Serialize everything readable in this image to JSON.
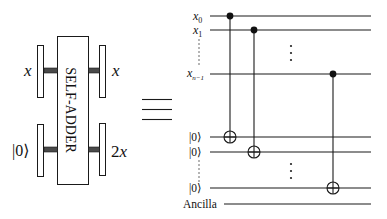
{
  "diagram": {
    "type": "quantum-circuit-equivalence",
    "colors": {
      "ink": "#1a1a1a",
      "connector": "#4a4a4a",
      "background": "#ffffff"
    },
    "block": {
      "label": "SELF-ADDER",
      "inputs": [
        {
          "label_var": "x",
          "label_text": "x"
        },
        {
          "label_text": "|0⟩"
        }
      ],
      "outputs": [
        {
          "label_var": "x",
          "label_text": "x"
        },
        {
          "label_text": "2x",
          "label_num": "2",
          "label_var": "x"
        }
      ]
    },
    "equivalence_symbol": "≡",
    "circuit": {
      "wires": [
        {
          "id": "x0",
          "label_var": "x",
          "label_sub": "0"
        },
        {
          "id": "x1",
          "label_var": "x",
          "label_sub": "1"
        },
        {
          "id": "xn1",
          "label_var": "x",
          "label_sub": "n−1"
        },
        {
          "id": "z0",
          "label_text": "|0⟩"
        },
        {
          "id": "z1",
          "label_text": "|0⟩"
        },
        {
          "id": "zn1",
          "label_text": "|0⟩"
        },
        {
          "id": "anc",
          "label_text": "Ancilla"
        }
      ],
      "gates": [
        {
          "type": "CNOT",
          "control": "x0",
          "target": "z0"
        },
        {
          "type": "CNOT",
          "control": "x1",
          "target": "z1"
        },
        {
          "type": "CNOT",
          "control": "xn1",
          "target": "zn1"
        }
      ],
      "ellipsis": "⋮"
    }
  }
}
